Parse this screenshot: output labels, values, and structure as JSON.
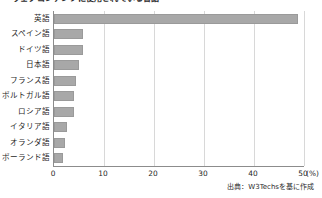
{
  "chart_data": {
    "type": "bar",
    "orientation": "horizontal",
    "title": "ウェブコンテンツに使用されている言語",
    "categories": [
      "英語",
      "スペイン語",
      "ドイツ語",
      "日本語",
      "フランス語",
      "ポルトガル語",
      "ロシア語",
      "イタリア語",
      "オランダ語",
      "ポーランド語"
    ],
    "values": [
      48.8,
      5.8,
      5.8,
      5.0,
      4.3,
      3.9,
      3.9,
      2.5,
      2.1,
      1.7
    ],
    "series": [
      {
        "name": "シェア",
        "values": [
          48.8,
          5.8,
          5.8,
          5.0,
          4.3,
          3.9,
          3.9,
          2.5,
          2.1,
          1.7
        ]
      }
    ],
    "xlabel": "(%)",
    "ylabel": "",
    "xlim": [
      0,
      50
    ],
    "xticks": [
      0,
      10,
      20,
      30,
      40,
      50
    ],
    "xtick_labels": [
      "0",
      "10",
      "20",
      "30",
      "40",
      "50"
    ],
    "unit_label": "(%)",
    "grid": "vertical",
    "legend": "none",
    "bar_color": "#a8a8a8",
    "axis_color": "#8c8c8c",
    "gridline_color": "#d8d8d8",
    "source_note": "出典：W3Techsを基に作成"
  }
}
